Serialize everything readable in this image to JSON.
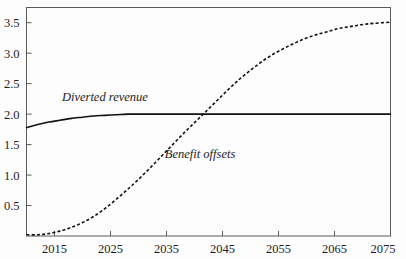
{
  "chart_data": {
    "type": "line",
    "title": "",
    "subtitle": "",
    "xlabel": "",
    "ylabel": "",
    "xlim": [
      2010,
      2075
    ],
    "ylim": [
      0,
      3.75
    ],
    "grid": false,
    "legend_position": "inline-annotations",
    "x_ticks": [
      2015,
      2025,
      2035,
      2045,
      2055,
      2065,
      2075
    ],
    "x_tick_labels": [
      "2015",
      "2025",
      "2035",
      "2045",
      "2055",
      "2065",
      "2075"
    ],
    "y_ticks": [
      0.5,
      1.0,
      1.5,
      2.0,
      2.5,
      3.0,
      3.5
    ],
    "y_tick_labels": [
      "0.5",
      "1.0",
      "1.5",
      "2.0",
      "2.5",
      "3.0",
      "3.5"
    ],
    "x": [
      2010,
      2012,
      2014,
      2016,
      2018,
      2020,
      2022,
      2024,
      2026,
      2028,
      2030,
      2032,
      2034,
      2036,
      2038,
      2040,
      2042,
      2044,
      2046,
      2048,
      2050,
      2052,
      2054,
      2056,
      2058,
      2060,
      2062,
      2064,
      2066,
      2068,
      2070,
      2072,
      2075
    ],
    "series": [
      {
        "name": "Diverted revenue",
        "style": "solid",
        "color": "#111111",
        "label_x": 2024,
        "label_y": 2.22,
        "values": [
          1.78,
          1.83,
          1.87,
          1.9,
          1.93,
          1.95,
          1.97,
          1.98,
          1.99,
          2.0,
          2.0,
          2.0,
          2.0,
          2.0,
          2.0,
          2.0,
          2.0,
          2.0,
          2.0,
          2.0,
          2.0,
          2.0,
          2.0,
          2.0,
          2.0,
          2.0,
          2.0,
          2.0,
          2.0,
          2.0,
          2.0,
          2.0,
          2.0
        ]
      },
      {
        "name": "Benefit offsets",
        "style": "dashed",
        "color": "#111111",
        "label_x": 2041,
        "label_y": 1.28,
        "values": [
          0.02,
          0.02,
          0.04,
          0.08,
          0.14,
          0.22,
          0.32,
          0.45,
          0.6,
          0.76,
          0.93,
          1.11,
          1.3,
          1.49,
          1.68,
          1.86,
          2.04,
          2.22,
          2.4,
          2.57,
          2.72,
          2.86,
          2.98,
          3.08,
          3.17,
          3.25,
          3.31,
          3.36,
          3.41,
          3.44,
          3.47,
          3.49,
          3.51
        ]
      }
    ],
    "axis_color": "#5a5a5a",
    "background": "#fdfdfd"
  }
}
